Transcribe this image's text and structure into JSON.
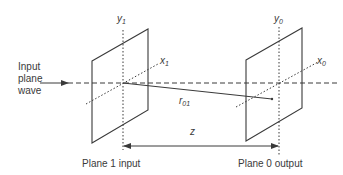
{
  "diagram": {
    "input_label_lines": [
      "Input",
      "plane",
      "wave"
    ],
    "plane1": {
      "axis_y": {
        "base": "y",
        "sub": "1"
      },
      "axis_x": {
        "base": "x",
        "sub": "1"
      },
      "caption": "Plane 1 input"
    },
    "plane0": {
      "axis_y": {
        "base": "y",
        "sub": "0"
      },
      "axis_x": {
        "base": "x",
        "sub": "0"
      },
      "caption": "Plane 0 output"
    },
    "ray_label": {
      "base": "r",
      "sub": "01"
    },
    "distance_label": "z",
    "colors": {
      "stroke": "#3a3a3a",
      "text": "#3a3a3a",
      "background": "#ffffff"
    }
  }
}
